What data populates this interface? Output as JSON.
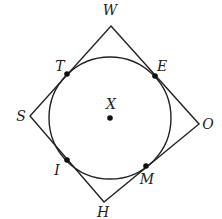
{
  "diagram": {
    "center": {
      "label": "X",
      "x": 110,
      "y": 118
    },
    "circle": {
      "cx": 110,
      "cy": 118,
      "r": 61
    },
    "polygon": {
      "vertices": [
        {
          "label": "W",
          "x": 111,
          "y": 26,
          "lx": 110,
          "ly": 15
        },
        {
          "label": "O",
          "x": 199,
          "y": 124,
          "lx": 208,
          "ly": 129
        },
        {
          "label": "H",
          "x": 104,
          "y": 202,
          "lx": 103,
          "ly": 217
        },
        {
          "label": "S",
          "x": 30,
          "y": 116,
          "lx": 21,
          "ly": 121
        }
      ]
    },
    "tangent_points": [
      {
        "label": "T",
        "x": 67,
        "y": 74,
        "lx": 60,
        "ly": 71
      },
      {
        "label": "E",
        "x": 155,
        "y": 76,
        "lx": 162,
        "ly": 71
      },
      {
        "label": "M",
        "x": 146,
        "y": 166,
        "lx": 147,
        "ly": 184
      },
      {
        "label": "I",
        "x": 67,
        "y": 160,
        "lx": 57,
        "ly": 175
      }
    ],
    "stroke_color": "#222222"
  }
}
